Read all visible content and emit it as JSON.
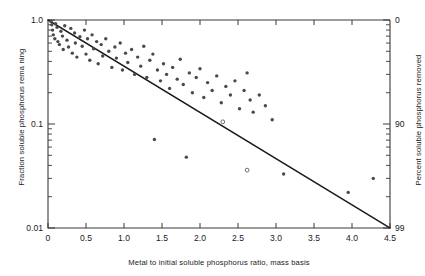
{
  "chart_data": {
    "type": "scatter",
    "title": "",
    "xlabel": "Metal to initial soluble phosphorus ratio, mass basis",
    "ylabel": "Fraction soluble phosphorus rema ning",
    "y2label": "Percent soluble phosphorus removed",
    "xlim": [
      0,
      4.5
    ],
    "ylim": [
      0.01,
      1.0
    ],
    "yscale": "log",
    "xscale": "linear",
    "grid": false,
    "legend": null,
    "x_ticks": [
      0,
      0.5,
      1.0,
      1.5,
      2.0,
      2.5,
      3.0,
      3.5,
      4.0,
      4.5
    ],
    "x_ticklabels": [
      "0",
      "0.5",
      "1.0",
      "1.5",
      "2.0",
      "2.5",
      "3.0",
      "3.5",
      "4.0",
      "4.5"
    ],
    "y_ticks": [
      1.0,
      0.1,
      0.01
    ],
    "y_ticklabels": [
      "1.0",
      "0.1",
      "0.01"
    ],
    "y2_ticks": [
      0,
      90,
      99
    ],
    "y2_ticklabels": [
      "0",
      "90",
      "99"
    ],
    "fit_line": {
      "name": "fitted regression line",
      "x": [
        0.0,
        4.5
      ],
      "y": [
        1.0,
        0.01
      ],
      "description": "log-linear fit spanning full axis range"
    },
    "series": [
      {
        "name": "observations",
        "marker": "filled circle",
        "points": [
          [
            0.04,
            0.97
          ],
          [
            0.05,
            0.9
          ],
          [
            0.06,
            0.8
          ],
          [
            0.07,
            0.72
          ],
          [
            0.09,
            0.66
          ],
          [
            0.1,
            0.92
          ],
          [
            0.12,
            0.85
          ],
          [
            0.13,
            0.62
          ],
          [
            0.15,
            0.58
          ],
          [
            0.17,
            0.78
          ],
          [
            0.19,
            0.7
          ],
          [
            0.2,
            0.52
          ],
          [
            0.22,
            0.88
          ],
          [
            0.25,
            0.64
          ],
          [
            0.27,
            0.55
          ],
          [
            0.3,
            0.83
          ],
          [
            0.32,
            0.48
          ],
          [
            0.35,
            0.75
          ],
          [
            0.36,
            0.6
          ],
          [
            0.38,
            0.44
          ],
          [
            0.42,
            0.69
          ],
          [
            0.45,
            0.56
          ],
          [
            0.48,
            0.8
          ],
          [
            0.5,
            0.47
          ],
          [
            0.52,
            0.66
          ],
          [
            0.55,
            0.41
          ],
          [
            0.58,
            0.72
          ],
          [
            0.6,
            0.53
          ],
          [
            0.64,
            0.62
          ],
          [
            0.66,
            0.38
          ],
          [
            0.7,
            0.58
          ],
          [
            0.72,
            0.45
          ],
          [
            0.76,
            0.66
          ],
          [
            0.8,
            0.5
          ],
          [
            0.84,
            0.35
          ],
          [
            0.88,
            0.55
          ],
          [
            0.9,
            0.43
          ],
          [
            0.95,
            0.6
          ],
          [
            0.98,
            0.33
          ],
          [
            1.02,
            0.48
          ],
          [
            1.05,
            0.39
          ],
          [
            1.1,
            0.52
          ],
          [
            1.14,
            0.3
          ],
          [
            1.18,
            0.44
          ],
          [
            1.22,
            0.36
          ],
          [
            1.26,
            0.56
          ],
          [
            1.3,
            0.28
          ],
          [
            1.34,
            0.41
          ],
          [
            1.38,
            0.47
          ],
          [
            1.4,
            0.071
          ],
          [
            1.44,
            0.33
          ],
          [
            1.48,
            0.26
          ],
          [
            1.52,
            0.38
          ],
          [
            1.56,
            0.3
          ],
          [
            1.6,
            0.22
          ],
          [
            1.64,
            0.35
          ],
          [
            1.7,
            0.27
          ],
          [
            1.74,
            0.42
          ],
          [
            1.78,
            0.24
          ],
          [
            1.82,
            0.048
          ],
          [
            1.86,
            0.31
          ],
          [
            1.9,
            0.2
          ],
          [
            1.95,
            0.28
          ],
          [
            2.0,
            0.34
          ],
          [
            2.05,
            0.18
          ],
          [
            2.1,
            0.25
          ],
          [
            2.16,
            0.21
          ],
          [
            2.22,
            0.29
          ],
          [
            2.28,
            0.16
          ],
          [
            2.34,
            0.23
          ],
          [
            2.4,
            0.19
          ],
          [
            2.46,
            0.26
          ],
          [
            2.52,
            0.14
          ],
          [
            2.58,
            0.21
          ],
          [
            2.62,
            0.31
          ],
          [
            2.66,
            0.17
          ],
          [
            2.7,
            0.13
          ],
          [
            2.78,
            0.19
          ],
          [
            2.86,
            0.15
          ],
          [
            2.95,
            0.11
          ],
          [
            3.1,
            0.033
          ],
          [
            3.95,
            0.022
          ],
          [
            4.28,
            0.03
          ]
        ]
      },
      {
        "name": "observations-open",
        "marker": "open circle",
        "points": [
          [
            2.3,
            0.105
          ],
          [
            2.62,
            0.036
          ]
        ]
      }
    ]
  },
  "colors": {
    "axis": "#3a3a3a",
    "line": "#1b1b1b",
    "marker": "#4a4a4a",
    "background": "#ffffff"
  }
}
